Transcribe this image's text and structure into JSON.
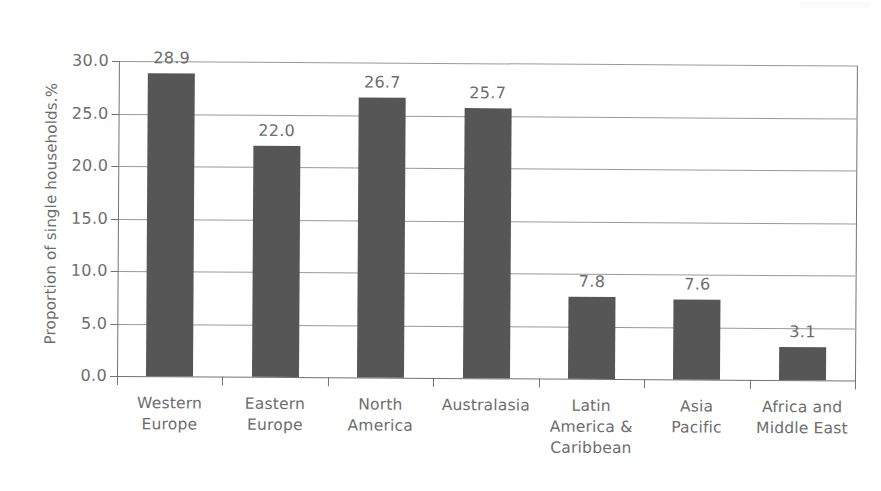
{
  "chart_data": {
    "type": "bar",
    "title": "",
    "xlabel": "",
    "ylabel": "Proportion of single households.%",
    "ylim": [
      0.0,
      30.0
    ],
    "ytick_labels": [
      "30.0",
      "25.0",
      "20.0",
      "15.0",
      "10.0",
      "5.0",
      "0.0"
    ],
    "ytick_values": [
      30.0,
      25.0,
      20.0,
      15.0,
      10.0,
      5.0,
      0.0
    ],
    "grid": true,
    "legend": "none",
    "bar_color": "#565656",
    "axis_color": "#737373",
    "text_color": "#6d6d6d",
    "categories": [
      "Western Europe",
      "Eastern Europe",
      "North America",
      "Australasia",
      "Latin America & Caribbean",
      "Asia Pacific",
      "Africa and Middle East"
    ],
    "category_label_lines": [
      [
        "Western",
        "Europe"
      ],
      [
        "Eastern",
        "Europe"
      ],
      [
        "North",
        "America"
      ],
      [
        "Australasia"
      ],
      [
        "Latin",
        "America &",
        "Caribbean"
      ],
      [
        "Asia",
        "Pacific"
      ],
      [
        "Africa and",
        "Middle East"
      ]
    ],
    "values": [
      28.9,
      22.0,
      26.7,
      25.7,
      7.8,
      7.6,
      3.1
    ],
    "value_labels": [
      "28.9",
      "22.0",
      "26.7",
      "25.7",
      "7.8",
      "7.6",
      "3.1"
    ]
  }
}
